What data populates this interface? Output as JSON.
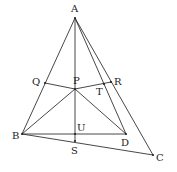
{
  "diagram": {
    "type": "geometry-figure",
    "points": {
      "A": {
        "x": 75,
        "y": 18,
        "label": "A",
        "lx": 71,
        "ly": 12
      },
      "B": {
        "x": 22,
        "y": 134,
        "label": "B",
        "lx": 12,
        "ly": 139
      },
      "C": {
        "x": 153,
        "y": 155,
        "label": "C",
        "lx": 156,
        "ly": 161
      },
      "D": {
        "x": 126,
        "y": 134,
        "label": "D",
        "lx": 121,
        "ly": 146
      },
      "P": {
        "x": 75,
        "y": 89,
        "label": "P",
        "lx": 73,
        "ly": 84
      },
      "Q": {
        "x": 45,
        "y": 83,
        "label": "Q",
        "lx": 32,
        "ly": 85
      },
      "R": {
        "x": 111,
        "y": 82,
        "label": "R",
        "lx": 114,
        "ly": 85
      },
      "T": {
        "x": 104,
        "y": 84,
        "label": "T",
        "lx": 96,
        "ly": 95
      },
      "U": {
        "x": 75,
        "y": 134,
        "label": "U",
        "lx": 77,
        "ly": 131
      },
      "S": {
        "x": 75,
        "y": 141,
        "label": "S",
        "lx": 71,
        "ly": 154
      }
    },
    "segments": [
      [
        "A",
        "B"
      ],
      [
        "A",
        "C"
      ],
      [
        "A",
        "D"
      ],
      [
        "A",
        "S"
      ],
      [
        "B",
        "C"
      ],
      [
        "B",
        "D"
      ],
      [
        "B",
        "P"
      ],
      [
        "P",
        "D"
      ],
      [
        "Q",
        "P"
      ],
      [
        "P",
        "R"
      ]
    ]
  }
}
